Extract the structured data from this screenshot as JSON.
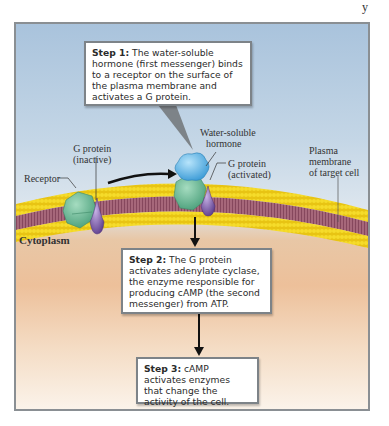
{
  "diagram": {
    "type": "biological-pathway",
    "topic": "Second messenger (cAMP) signaling by water-soluble hormone",
    "colors": {
      "extracellular_top": "#a9c3dc",
      "cytoplasm": "#edc09a",
      "membrane_heads": "#f0d21e",
      "membrane_tails": "#9c5a6a",
      "receptor": "#6fbf9a",
      "hormone": "#5fb3e6",
      "g_protein": "#7d5ea8",
      "arrow": "#111111",
      "frame_border": "#8a8f93"
    },
    "corner_mark": "y",
    "steps": [
      {
        "id": 1,
        "label": "Step 1:",
        "text": " The water-soluble hormone (first messenger) binds to a receptor on the surface of the plasma membrane and activates a G protein."
      },
      {
        "id": 2,
        "label": "Step 2:",
        "text": " The G protein activates adenylate cyclase, the enzyme responsible for producing cAMP (the second messenger) from ATP."
      },
      {
        "id": 3,
        "label": "Step 3:",
        "text": " cAMP activates enzymes that change the activity of the cell."
      }
    ],
    "labels": {
      "receptor": "Receptor",
      "g_protein_inactive_line1": "G protein",
      "g_protein_inactive_line2": "(inactive)",
      "hormone_line1": "Water-soluble",
      "hormone_line2": "hormone",
      "g_protein_activated_line1": "G protein",
      "g_protein_activated_line2": "(activated)",
      "plasma_membrane_line1": "Plasma",
      "plasma_membrane_line2": "membrane",
      "plasma_membrane_line3": "of target cell",
      "cytoplasm": "Cytoplasm"
    }
  }
}
